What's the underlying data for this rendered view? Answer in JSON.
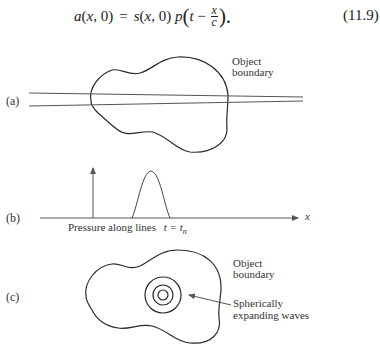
{
  "equation": {
    "lhs": "a(x, 0)",
    "equals": "=",
    "rhs_prefix": "s(x, 0) p",
    "open_paren": "(",
    "t_minus": "t −",
    "frac_num": "x",
    "frac_den": "c",
    "close_paren": ").",
    "number": "(11.9)"
  },
  "figure": {
    "panel_a": {
      "label": "(a)",
      "annotation_line1": "Object",
      "annotation_line2": "boundary"
    },
    "panel_b": {
      "label": "(b)",
      "axis_label": "x",
      "caption_text": "Pressure along lines",
      "caption_math": "t = t",
      "caption_sub": "n"
    },
    "panel_c": {
      "label": "(c)",
      "annotation_line1": "Object",
      "annotation_line2": "boundary",
      "arrow_label_line1": "Spherically",
      "arrow_label_line2": "expanding waves"
    },
    "colors": {
      "stroke": "#2a2a2a",
      "line": "#555555"
    }
  }
}
